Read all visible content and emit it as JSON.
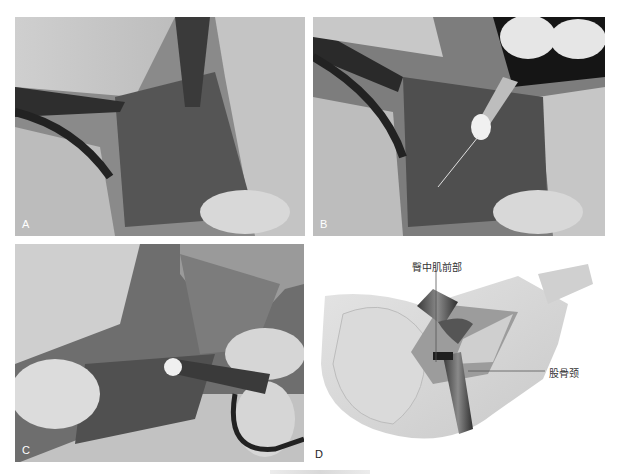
{
  "figure": {
    "panels": [
      {
        "id": "A",
        "label": "A",
        "type": "photograph",
        "description": "Intraoperative view: retractor exposing surgical field, gloved finger at bottom right"
      },
      {
        "id": "B",
        "label": "B",
        "type": "photograph",
        "description": "Intraoperative view: instrument with white tip inserted into field, retractor at upper left"
      },
      {
        "id": "C",
        "label": "C",
        "type": "photograph",
        "description": "Intraoperative view: close-up with instrument and gloved fingers"
      },
      {
        "id": "D",
        "label": "D",
        "type": "illustration",
        "description": "Schematic of hip exposure with retractors",
        "annotations": [
          {
            "id": "gluteus-medius-anterior",
            "text": "臀中肌前部"
          },
          {
            "id": "femoral-neck",
            "text": "股骨颈"
          }
        ]
      }
    ]
  },
  "colors": {
    "background": "#ffffff",
    "photo_tone": "#6b6b6b",
    "label_on_photo": "#ffffff",
    "label_text": "#333333"
  }
}
